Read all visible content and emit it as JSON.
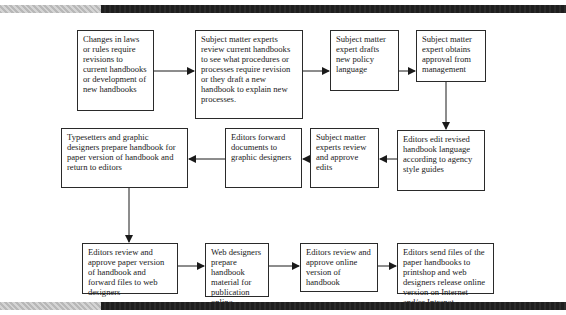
{
  "diagram": {
    "type": "flowchart",
    "steps": [
      {
        "id": 1,
        "text": "Changes in laws or rules require revisions to current handbooks or development of new handbooks"
      },
      {
        "id": 2,
        "text": "Subject matter experts review current handbooks to see what procedures or processes require revision or they draft a new handbook to explain new processes."
      },
      {
        "id": 3,
        "text": "Subject matter expert drafts new policy language"
      },
      {
        "id": 4,
        "text": "Subject matter expert obtains approval from management"
      },
      {
        "id": 5,
        "text": "Editors edit revised handbook language according to agency style guides"
      },
      {
        "id": 6,
        "text": "Subject matter experts review and approve edits"
      },
      {
        "id": 7,
        "text": "Editors forward documents to graphic designers"
      },
      {
        "id": 8,
        "text": "Typesetters and graphic designers prepare handbook for paper version of handbook and return to editors"
      },
      {
        "id": 9,
        "text": "Editors review and approve paper version of handbook and forward files to web designers"
      },
      {
        "id": 10,
        "text": "Web designers prepare handbook material for publication online"
      },
      {
        "id": 11,
        "text": "Editors review and approve online version of handbook"
      },
      {
        "id": 12,
        "text": "Editors send files of the paper handbooks to printshop and web designers release online version on Internet and/or Intranet"
      }
    ],
    "edges": [
      {
        "from": 1,
        "to": 2
      },
      {
        "from": 2,
        "to": 3
      },
      {
        "from": 3,
        "to": 4
      },
      {
        "from": 4,
        "to": 5
      },
      {
        "from": 5,
        "to": 6
      },
      {
        "from": 6,
        "to": 7
      },
      {
        "from": 7,
        "to": 8
      },
      {
        "from": 8,
        "to": 9
      },
      {
        "from": 9,
        "to": 10
      },
      {
        "from": 10,
        "to": 11
      },
      {
        "from": 11,
        "to": 12
      }
    ]
  },
  "colors": {
    "border": "#2a2a2a",
    "arrow": "#1a1a1a",
    "bar_dark": "#222222",
    "bar_light": "#c4c4c4"
  }
}
